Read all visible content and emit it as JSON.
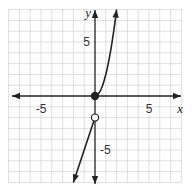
{
  "chart_data": {
    "type": "line",
    "title": "",
    "xlabel": "x",
    "ylabel": "y",
    "xlim": [
      -8,
      8
    ],
    "ylim": [
      -8,
      8
    ],
    "grid": true,
    "grid_step": 1,
    "tick_labels": {
      "x": [
        {
          "value": -5,
          "label": "-5"
        },
        {
          "value": 5,
          "label": "5"
        }
      ],
      "y": [
        {
          "value": 5,
          "label": "5"
        },
        {
          "value": -5,
          "label": "-5"
        }
      ]
    },
    "series": [
      {
        "name": "piece-1",
        "description": "y = 2x^2 for x >= 0",
        "x": [
          0,
          0.5,
          1,
          1.5,
          2
        ],
        "values": [
          0,
          0.5,
          2,
          4.5,
          8
        ],
        "start_point": {
          "x": 0,
          "y": 0,
          "style": "closed"
        },
        "end_arrow": true
      },
      {
        "name": "piece-2",
        "description": "y = 3x - 2 for x < 0",
        "x": [
          0,
          -2
        ],
        "values": [
          -2,
          -8
        ],
        "start_point": {
          "x": 0,
          "y": -2,
          "style": "open"
        },
        "end_arrow": true
      }
    ],
    "colors": {
      "curve": "#222222",
      "grid": "#b5b5b5",
      "axis": "#222222",
      "background": "#ffffff"
    }
  }
}
